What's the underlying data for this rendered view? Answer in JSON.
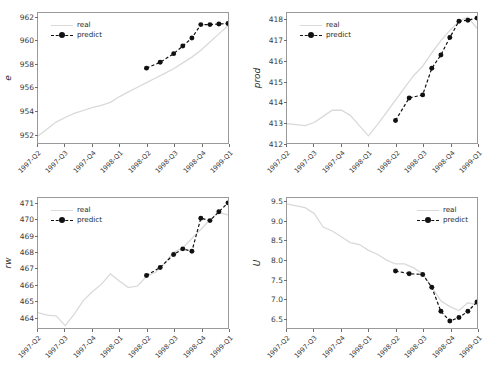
{
  "figure": {
    "background": "#ffffff",
    "panel_count": 4,
    "layout": "2x2 grid of line charts",
    "series_colors": {
      "real": "#d9d9d9",
      "predict": "#111111"
    }
  },
  "legend": {
    "real_label": "real",
    "predict_label": "predict"
  },
  "chart_data": [
    {
      "id": "e",
      "type": "line",
      "title": "",
      "xlabel": "",
      "ylabel": "e",
      "position": "top-left",
      "legend_position": "upper left",
      "grid": false,
      "ylim": [
        951.2,
        962.4
      ],
      "yticks": [
        952,
        954,
        956,
        958,
        960,
        962
      ],
      "ytick_labels": [
        "952",
        "954",
        "956",
        "958",
        "960",
        "962"
      ],
      "x": [
        "1997-Q2",
        "1997-Q3",
        "1997-Q4",
        "1998-Q1",
        "1998-Q2",
        "1998-Q3",
        "1998-Q4",
        "1999-Q1"
      ],
      "xtick_labels": [
        "1997-Q2",
        "1997-Q3",
        "1997-Q4",
        "1998-Q1",
        "1998-Q2",
        "1998-Q3",
        "1998-Q4",
        "1999-Q1"
      ],
      "series": [
        {
          "name": "real",
          "style": "solid",
          "x_frac": [
            0.0,
            0.048,
            0.095,
            0.143,
            0.19,
            0.238,
            0.286,
            0.333,
            0.381,
            0.429,
            0.476,
            0.524,
            0.571,
            0.619,
            0.667,
            0.714,
            0.762,
            0.81,
            0.857,
            0.905,
            0.952,
            1.0
          ],
          "values": [
            951.8,
            952.4,
            953.0,
            953.4,
            953.75,
            954.0,
            954.25,
            954.45,
            954.7,
            955.2,
            955.6,
            956.0,
            956.4,
            956.8,
            957.2,
            957.6,
            958.1,
            958.6,
            959.2,
            959.9,
            960.6,
            961.3
          ]
        },
        {
          "name": "predict",
          "style": "dashed-marker",
          "x_frac": [
            0.571,
            0.643,
            0.714,
            0.762,
            0.81,
            0.857,
            0.905,
            0.952,
            1.0
          ],
          "values": [
            957.65,
            958.15,
            958.9,
            959.55,
            960.25,
            961.4,
            961.4,
            961.45,
            961.5
          ]
        }
      ]
    },
    {
      "id": "prod",
      "type": "line",
      "title": "",
      "xlabel": "",
      "ylabel": "prod",
      "position": "top-right",
      "legend_position": "upper left",
      "grid": false,
      "ylim": [
        412.0,
        418.35
      ],
      "yticks": [
        412,
        413,
        414,
        415,
        416,
        417,
        418
      ],
      "ytick_labels": [
        "412",
        "413",
        "414",
        "415",
        "416",
        "417",
        "418"
      ],
      "x": [
        "1997-Q2",
        "1997-Q3",
        "1997-Q4",
        "1998-Q1",
        "1998-Q2",
        "1998-Q3",
        "1998-Q4",
        "1999-Q1"
      ],
      "xtick_labels": [
        "1997-Q2",
        "1997-Q3",
        "1997-Q4",
        "1998-Q1",
        "1998-Q2",
        "1998-Q3",
        "1998-Q4",
        "1999-Q1"
      ],
      "series": [
        {
          "name": "real",
          "style": "solid",
          "x_frac": [
            0.0,
            0.048,
            0.095,
            0.143,
            0.19,
            0.238,
            0.286,
            0.333,
            0.381,
            0.429,
            0.476,
            0.524,
            0.571,
            0.619,
            0.667,
            0.714,
            0.762,
            0.81,
            0.857,
            0.905,
            0.952,
            1.0
          ],
          "values": [
            412.95,
            412.9,
            412.85,
            413.0,
            413.3,
            413.6,
            413.6,
            413.35,
            412.85,
            412.35,
            412.9,
            413.5,
            414.1,
            414.7,
            415.3,
            415.75,
            416.4,
            417.0,
            417.5,
            417.95,
            418.15,
            417.6
          ]
        },
        {
          "name": "predict",
          "style": "dashed-marker",
          "x_frac": [
            0.571,
            0.643,
            0.714,
            0.762,
            0.81,
            0.857,
            0.905,
            0.952,
            1.0
          ],
          "values": [
            413.1,
            414.2,
            414.35,
            415.65,
            416.3,
            417.15,
            417.95,
            418.0,
            418.1
          ]
        }
      ]
    },
    {
      "id": "rw",
      "type": "line",
      "title": "",
      "xlabel": "",
      "ylabel": "rw",
      "position": "bottom-left",
      "legend_position": "upper left",
      "grid": false,
      "ylim": [
        463.3,
        471.35
      ],
      "yticks": [
        464,
        465,
        466,
        467,
        468,
        469,
        470,
        471
      ],
      "ytick_labels": [
        "464",
        "465",
        "466",
        "467",
        "468",
        "469",
        "470",
        "471"
      ],
      "x": [
        "1997-Q2",
        "1997-Q3",
        "1997-Q4",
        "1998-Q1",
        "1998-Q2",
        "1998-Q3",
        "1998-Q4",
        "1999-Q1"
      ],
      "xtick_labels": [
        "1997-Q2",
        "1997-Q3",
        "1997-Q4",
        "1998-Q1",
        "1998-Q2",
        "1998-Q3",
        "1998-Q4",
        "1999-Q1"
      ],
      "series": [
        {
          "name": "real",
          "style": "solid",
          "x_frac": [
            0.0,
            0.048,
            0.095,
            0.143,
            0.19,
            0.238,
            0.286,
            0.333,
            0.381,
            0.429,
            0.476,
            0.524,
            0.571,
            0.619,
            0.667,
            0.714,
            0.762,
            0.81,
            0.857,
            0.905,
            0.952,
            1.0
          ],
          "values": [
            464.25,
            464.1,
            464.05,
            463.45,
            464.15,
            465.0,
            465.55,
            466.0,
            466.65,
            466.2,
            465.8,
            465.9,
            466.5,
            466.75,
            467.3,
            468.0,
            468.25,
            468.85,
            469.4,
            470.0,
            470.45,
            470.3
          ]
        },
        {
          "name": "predict",
          "style": "dashed-marker",
          "x_frac": [
            0.571,
            0.643,
            0.714,
            0.762,
            0.81,
            0.857,
            0.905,
            0.952,
            1.0
          ],
          "values": [
            466.55,
            467.05,
            467.85,
            468.2,
            468.05,
            470.1,
            469.95,
            470.5,
            471.05
          ]
        }
      ]
    },
    {
      "id": "U",
      "type": "line",
      "title": "",
      "xlabel": "",
      "ylabel": "U",
      "position": "bottom-right",
      "legend_position": "upper right",
      "grid": false,
      "ylim": [
        6.25,
        9.6
      ],
      "yticks": [
        6.5,
        7.0,
        7.5,
        8.0,
        8.5,
        9.0,
        9.5
      ],
      "ytick_labels": [
        "6.5",
        "7.0",
        "7.5",
        "8.0",
        "8.5",
        "9.0",
        "9.5"
      ],
      "x": [
        "1997-Q2",
        "1997-Q3",
        "1997-Q4",
        "1998-Q1",
        "1998-Q2",
        "1998-Q3",
        "1998-Q4",
        "1999-Q1"
      ],
      "xtick_labels": [
        "1997-Q2",
        "1997-Q3",
        "1997-Q4",
        "1998-Q1",
        "1998-Q2",
        "1998-Q3",
        "1998-Q4",
        "1999-Q1"
      ],
      "series": [
        {
          "name": "real",
          "style": "solid",
          "x_frac": [
            0.0,
            0.048,
            0.095,
            0.143,
            0.19,
            0.238,
            0.286,
            0.333,
            0.381,
            0.429,
            0.476,
            0.524,
            0.571,
            0.619,
            0.667,
            0.714,
            0.762,
            0.81,
            0.857,
            0.905,
            0.952,
            1.0
          ],
          "values": [
            9.45,
            9.4,
            9.35,
            9.2,
            8.85,
            8.75,
            8.6,
            8.45,
            8.4,
            8.25,
            8.15,
            8.0,
            7.9,
            7.9,
            7.8,
            7.65,
            7.3,
            6.95,
            6.8,
            6.7,
            6.9,
            6.85
          ]
        },
        {
          "name": "predict",
          "style": "dashed-marker",
          "x_frac": [
            0.571,
            0.643,
            0.714,
            0.762,
            0.81,
            0.857,
            0.905,
            0.952,
            1.0
          ],
          "values": [
            7.72,
            7.65,
            7.63,
            7.3,
            6.68,
            6.43,
            6.52,
            6.68,
            6.92
          ]
        }
      ]
    }
  ]
}
